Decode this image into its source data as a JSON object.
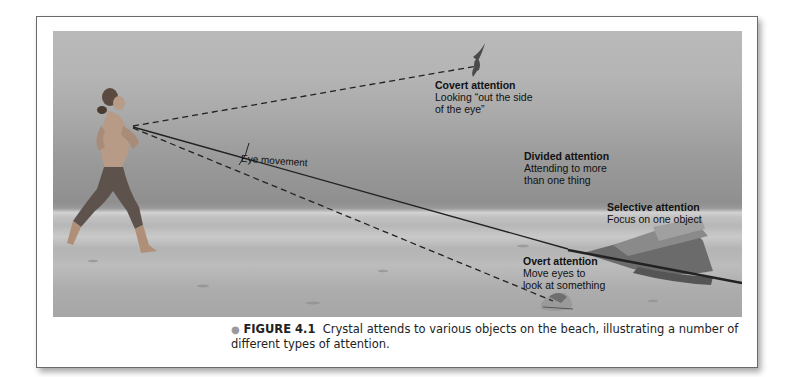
{
  "figure": {
    "number_label": "FIGURE 4.1",
    "caption": "Crystal attends to various objects on the beach, illustrating a number of different types of attention.",
    "bullet_color": "#9a9a9a"
  },
  "annotations": {
    "covert": {
      "title": "Covert attention",
      "desc_1": "Looking “out the side",
      "desc_2": "of the eye”"
    },
    "divided": {
      "title": "Divided attention",
      "desc_1": "Attending to more",
      "desc_2": "than one thing"
    },
    "selective": {
      "title": "Selective attention",
      "desc_1": "Focus on one object"
    },
    "overt": {
      "title": "Overt attention",
      "desc_1": "Move eyes to",
      "desc_2": "look at something"
    },
    "eye_movement": "Eye movement"
  },
  "scene": {
    "subject": "Crystal (runner)",
    "objects": [
      "seagull",
      "beach umbrella",
      "seashell"
    ]
  }
}
